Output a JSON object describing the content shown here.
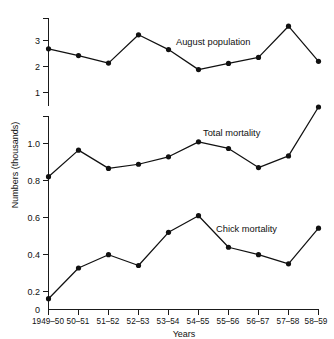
{
  "chart_data": {
    "type": "line",
    "title": "",
    "xlabel": "Years",
    "ylabel": "Numbers (thousands)",
    "grid": false,
    "legend_position": "inline-annotation",
    "categories": [
      "1949–50",
      "50–51",
      "51–52",
      "52–53",
      "53–54",
      "54–55",
      "55–56",
      "56–57",
      "57–58",
      "58–59"
    ],
    "panels": [
      {
        "name": "upper-panel",
        "ylim": [
          1.0,
          3.8
        ],
        "yticks": [
          1,
          2,
          3
        ],
        "ytick_labels": [
          "1",
          "2",
          "3"
        ],
        "series": [
          {
            "name": "August population",
            "label": "August population",
            "values": [
              2.68,
              2.42,
              2.13,
              3.22,
              2.65,
              1.88,
              2.12,
              2.35,
              3.55,
              2.2
            ]
          }
        ]
      },
      {
        "name": "lower-panel",
        "ylim": [
          0.0,
          1.28
        ],
        "yticks": [
          0,
          0.2,
          0.4,
          0.6,
          0.8,
          1.0
        ],
        "ytick_labels": [
          "0",
          "0.2",
          "0.4",
          "0.6",
          "0.8",
          "1.0"
        ],
        "series": [
          {
            "name": "Total mortality",
            "label": "Total mortality",
            "values": [
              0.8,
              0.96,
              0.85,
              0.875,
              0.92,
              1.01,
              0.97,
              0.855,
              0.925,
              1.22
            ]
          },
          {
            "name": "Chick mortality",
            "label": "Chick mortality",
            "values": [
              0.065,
              0.25,
              0.33,
              0.265,
              0.465,
              0.565,
              0.375,
              0.33,
              0.275,
              0.49
            ]
          }
        ]
      }
    ],
    "annotations": [
      {
        "text": "August population",
        "x": 176,
        "y": 45
      },
      {
        "text": "Total mortality",
        "x": 203,
        "y": 136
      },
      {
        "text": "Chick mortality",
        "x": 216,
        "y": 232
      }
    ]
  }
}
